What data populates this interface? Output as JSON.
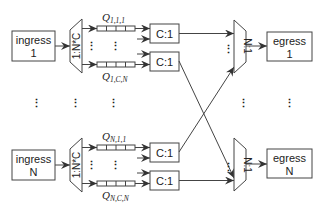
{
  "diagram": {
    "colors": {
      "stroke": "#444444",
      "text": "#222222",
      "background": "#ffffff"
    },
    "ingress": [
      {
        "line1": "ingress",
        "line2": "1"
      },
      {
        "line1": "ingress",
        "line2": "N"
      }
    ],
    "egress": [
      {
        "line1": "egress",
        "line2": "1"
      },
      {
        "line1": "egress",
        "line2": "N"
      }
    ],
    "demux_label": "1:N*C",
    "mux_label": "N:1",
    "arbiter_label": "C:1",
    "queues": {
      "top_first": {
        "main": "Q",
        "sub": "1,1,1"
      },
      "top_last": {
        "main": "Q",
        "sub": "1,C,N"
      },
      "bot_first": {
        "main": "Q",
        "sub": "N,1,1"
      },
      "bot_last": {
        "main": "Q",
        "sub": "N,C,N"
      }
    },
    "ellipsis_vertical": "⋮",
    "ellipsis_inline": "⋮"
  }
}
